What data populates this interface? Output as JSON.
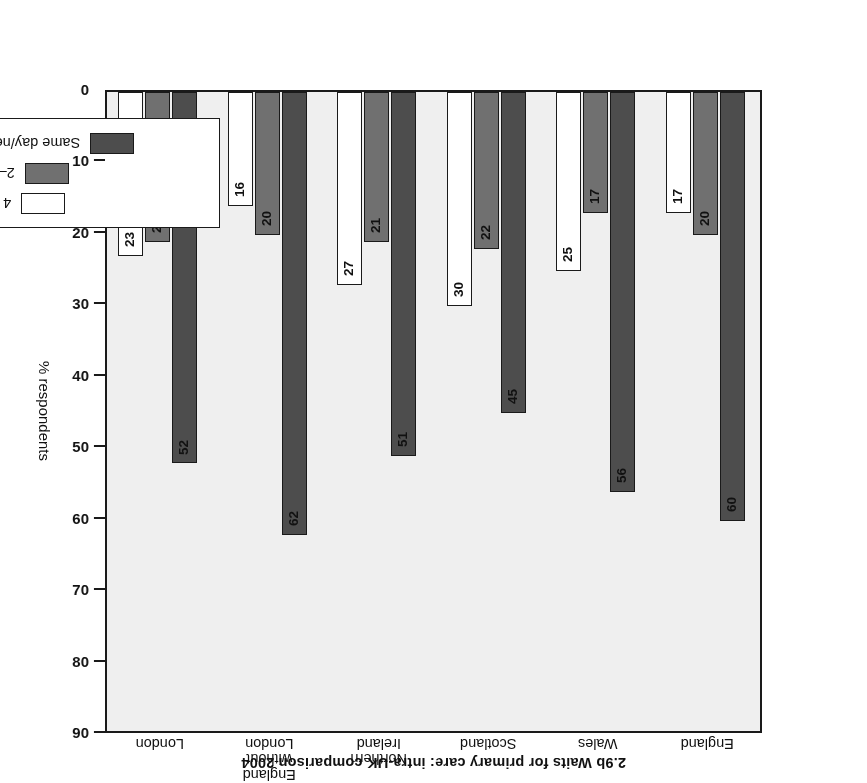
{
  "figure": {
    "number": "2.9b",
    "title": "2.9b  Waits for primary care: intra-UK comparison 2004",
    "orientation": "rotated-180"
  },
  "axis": {
    "y_title": "% respondents",
    "ticks": [
      "0",
      "10",
      "20",
      "30",
      "40",
      "50",
      "60",
      "70",
      "80",
      "90"
    ]
  },
  "legend": {
    "items": [
      {
        "label": "Same day/next day",
        "color": "#4d4d4d",
        "key": "same_day"
      },
      {
        "label": "2–3 days",
        "color": "#707070",
        "key": "two_three_days"
      },
      {
        "label": "4 days +",
        "color": "#ffffff",
        "key": "four_days_plus"
      }
    ]
  },
  "chart_data": {
    "type": "bar",
    "title": "2.9b  Waits for primary care: intra-UK comparison 2004",
    "xlabel": "",
    "ylabel": "% respondents",
    "ylim": [
      0,
      90
    ],
    "ytick_step": 10,
    "grid": false,
    "legend_position": "inside-lower-left",
    "orientation": "vertical-grouped-rotated-180",
    "categories": [
      "England",
      "Wales",
      "Scotland",
      "Northern\nIreland",
      "England\nwithout\nLondon",
      "London"
    ],
    "series": [
      {
        "name": "Same day/next day",
        "color": "#4d4d4d",
        "values": [
          60,
          56,
          45,
          51,
          62,
          52
        ]
      },
      {
        "name": "2–3 days",
        "color": "#707070",
        "values": [
          20,
          17,
          22,
          21,
          20,
          21
        ]
      },
      {
        "name": "4 days +",
        "color": "#ffffff",
        "values": [
          17,
          25,
          30,
          27,
          16,
          23
        ]
      }
    ]
  }
}
